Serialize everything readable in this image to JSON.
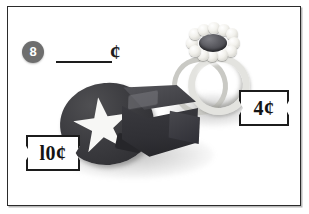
{
  "worksheet": {
    "question_number": "8",
    "answer_blank_placeholder": "",
    "currency_symbol": "¢"
  },
  "items": [
    {
      "name": "whistle",
      "icon": "whistle-icon",
      "price_label": "l0¢",
      "price_value": 10,
      "color": "#3a3a3e",
      "emblem": "white-star"
    },
    {
      "name": "ring",
      "icon": "ring-icon",
      "price_label": "4¢",
      "price_value": 4,
      "color": "#ddddd9",
      "emblem": "pearl-flower-gem"
    }
  ],
  "colors": {
    "frame_border": "#2b2b2b",
    "number_bubble": "#6e6e6e",
    "ink": "#1d1d1d",
    "page_background": "#ffffff",
    "whistle_dark": "#3a3a3e",
    "ring_silver": "#ddddd9",
    "gem_dark": "#4a4a50"
  }
}
